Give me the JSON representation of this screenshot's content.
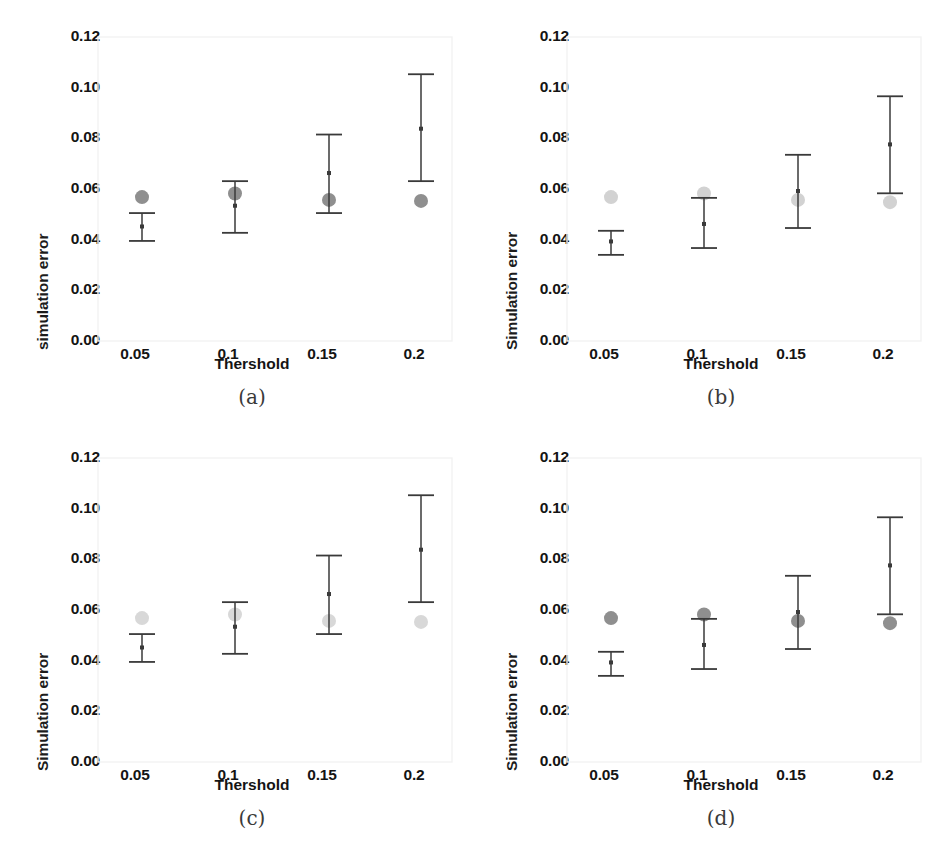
{
  "figure": {
    "panel_count": 4,
    "background": "#ffffff",
    "axis_color": "#f2f2f2",
    "errorbar_color": "#3a3a3a"
  },
  "chart_data": [
    {
      "type": "scatter",
      "panel": "a",
      "subcaption": "(a)",
      "title": "",
      "xlabel": "Thershold",
      "ylabel": "simulation error",
      "categories": [
        "0.05",
        "0.1",
        "0.15",
        "0.2"
      ],
      "x": [
        0.05,
        0.1,
        0.15,
        0.2
      ],
      "xtick_labels": [
        "0.05",
        "0.1",
        "0.15",
        "0.2"
      ],
      "ytick_labels": [
        "0.00",
        "0.02",
        "0.04",
        "0.06",
        "0.08",
        "0.10",
        "0.12"
      ],
      "yticks": [
        0.0,
        0.02,
        0.04,
        0.06,
        0.08,
        0.1,
        0.12
      ],
      "ylim": [
        0.0,
        0.12
      ],
      "grid": false,
      "legend": "none",
      "series": [
        {
          "name": "error-bar-mean",
          "marker": "errorbar",
          "color": "#3a3a3a",
          "values": [
            0.0452,
            0.0534,
            0.0663,
            0.0838
          ],
          "lower": [
            0.0395,
            0.0427,
            0.0505,
            0.0631
          ],
          "upper": [
            0.0505,
            0.0631,
            0.0815,
            0.1053
          ]
        },
        {
          "name": "reference-circle",
          "marker": "circle",
          "color": "#8f8f8f",
          "values": [
            0.0568,
            0.0582,
            0.0557,
            0.0553
          ]
        }
      ]
    },
    {
      "type": "scatter",
      "panel": "b",
      "subcaption": "(b)",
      "title": "",
      "xlabel": "Thershold",
      "ylabel": "Simulation error",
      "categories": [
        "0.05",
        "0.1",
        "0.15",
        "0.2"
      ],
      "x": [
        0.05,
        0.1,
        0.15,
        0.2
      ],
      "xtick_labels": [
        "0.05",
        "0.1",
        "0.15",
        "0.2"
      ],
      "ytick_labels": [
        "0.00",
        "0.02",
        "0.04",
        "0.06",
        "0.08",
        "0.10",
        "0.12"
      ],
      "yticks": [
        0.0,
        0.02,
        0.04,
        0.06,
        0.08,
        0.1,
        0.12
      ],
      "ylim": [
        0.0,
        0.12
      ],
      "grid": false,
      "legend": "none",
      "series": [
        {
          "name": "error-bar-mean",
          "marker": "errorbar",
          "color": "#3a3a3a",
          "values": [
            0.0393,
            0.0462,
            0.0592,
            0.0776
          ],
          "lower": [
            0.034,
            0.0367,
            0.0446,
            0.0583
          ],
          "upper": [
            0.0435,
            0.0565,
            0.0735,
            0.0966
          ]
        },
        {
          "name": "reference-circle",
          "marker": "circle",
          "color": "#d2d2d2",
          "values": [
            0.0568,
            0.0582,
            0.0557,
            0.0548
          ]
        }
      ]
    },
    {
      "type": "scatter",
      "panel": "c",
      "subcaption": "(c)",
      "title": "",
      "xlabel": "Thershold",
      "ylabel": "Simulation error",
      "categories": [
        "0.05",
        "0.1",
        "0.15",
        "0.2"
      ],
      "x": [
        0.05,
        0.1,
        0.15,
        0.2
      ],
      "xtick_labels": [
        "0.05",
        "0.1",
        "0.15",
        "0.2"
      ],
      "ytick_labels": [
        "0.00",
        "0.02",
        "0.04",
        "0.06",
        "0.08",
        "0.10",
        "0.12"
      ],
      "yticks": [
        0.0,
        0.02,
        0.04,
        0.06,
        0.08,
        0.1,
        0.12
      ],
      "ylim": [
        0.0,
        0.12
      ],
      "grid": false,
      "legend": "none",
      "series": [
        {
          "name": "error-bar-mean",
          "marker": "errorbar",
          "color": "#3a3a3a",
          "values": [
            0.0452,
            0.0534,
            0.0663,
            0.0838
          ],
          "lower": [
            0.0395,
            0.0427,
            0.0505,
            0.0631
          ],
          "upper": [
            0.0505,
            0.0631,
            0.0815,
            0.1053
          ]
        },
        {
          "name": "reference-circle",
          "marker": "circle",
          "color": "#d8d8d8",
          "values": [
            0.0568,
            0.0582,
            0.0557,
            0.0553
          ]
        }
      ]
    },
    {
      "type": "scatter",
      "panel": "d",
      "subcaption": "(d)",
      "title": "",
      "xlabel": "Thershold",
      "ylabel": "Simulation error",
      "categories": [
        "0.05",
        "0.1",
        "0.15",
        "0.2"
      ],
      "x": [
        0.05,
        0.1,
        0.15,
        0.2
      ],
      "xtick_labels": [
        "0.05",
        "0.1",
        "0.15",
        "0.2"
      ],
      "ytick_labels": [
        "0.00",
        "0.02",
        "0.04",
        "0.06",
        "0.08",
        "0.10",
        "0.12"
      ],
      "yticks": [
        0.0,
        0.02,
        0.04,
        0.06,
        0.08,
        0.1,
        0.12
      ],
      "ylim": [
        0.0,
        0.12
      ],
      "grid": false,
      "legend": "none",
      "series": [
        {
          "name": "error-bar-mean",
          "marker": "errorbar",
          "color": "#3a3a3a",
          "values": [
            0.0393,
            0.0462,
            0.0592,
            0.0776
          ],
          "lower": [
            0.034,
            0.0367,
            0.0446,
            0.0583
          ],
          "upper": [
            0.0435,
            0.0565,
            0.0735,
            0.0966
          ]
        },
        {
          "name": "reference-circle",
          "marker": "circle",
          "color": "#8f8f8f",
          "values": [
            0.0568,
            0.0582,
            0.0557,
            0.0548
          ]
        }
      ]
    }
  ]
}
